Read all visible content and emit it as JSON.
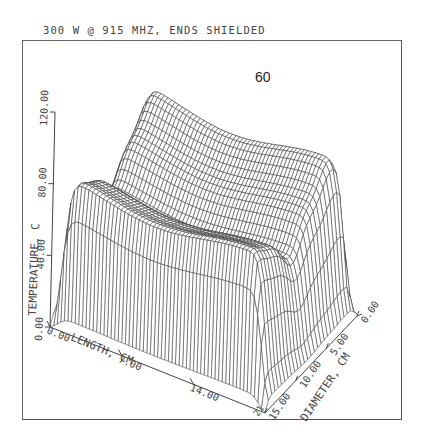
{
  "title": "300 W @ 915 MHZ, ENDS SHIELDED",
  "figure_number": "60",
  "chart_data": {
    "type": "surface3d",
    "title": "300 W @ 915 MHZ, ENDS SHIELDED",
    "annotation": "60",
    "zlabel": "TEMPERATURE, C",
    "xlabel": "LENGTH, CM",
    "ylabel": "DIAMETER, CM",
    "z_ticks": [
      "0.00",
      "40.00",
      "80.00",
      "120.00"
    ],
    "x_ticks": [
      "0.00",
      "7.00",
      "14.00"
    ],
    "y_ticks": [
      "15.00",
      "10.00",
      "5.00",
      "0.00"
    ],
    "zlim": [
      0,
      120
    ],
    "xlim": [
      0,
      21
    ],
    "ylim": [
      0,
      15
    ],
    "grid": false,
    "approx_values": {
      "edge_temperature_C": 70,
      "trough_temperature_C": 55,
      "ridge_peak_temperature_C": 90,
      "end_dip_min_temperature_C": 5
    }
  },
  "axes": {
    "z": {
      "label": "TEMPERATURE, C",
      "ticks": [
        "0.00",
        "40.00",
        "80.00",
        "120.00"
      ]
    },
    "x": {
      "label": "LENGTH, CM",
      "ticks": [
        "0.00",
        "7.00",
        "14.00"
      ],
      "end_tick": "21"
    },
    "y": {
      "label": "DIAMETER, CM",
      "ticks": [
        "15.00",
        "10.00",
        "5.00",
        "0.00"
      ]
    }
  }
}
